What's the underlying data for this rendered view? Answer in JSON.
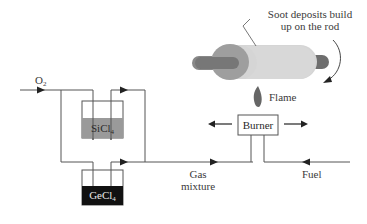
{
  "labels": {
    "o2": "O",
    "o2_sub": "2",
    "sicl": "SiCl",
    "sicl_sub": "4",
    "gecl": "GeCl",
    "gecl_sub": "4",
    "soot_line1": "Soot deposits build",
    "soot_line2": "up on the rod",
    "flame": "Flame",
    "burner": "Burner",
    "gas_line1": "Gas",
    "gas_line2": "mixture",
    "fuel": "Fuel"
  },
  "colors": {
    "line": "#555555",
    "sicl_fill": "#9a9a9a",
    "gecl_fill": "#111111",
    "rod_body": "#d4d4d4",
    "rod_disc": "#9e9e9e",
    "rod_shaft": "#7a7a7a",
    "flame": "#666666"
  }
}
